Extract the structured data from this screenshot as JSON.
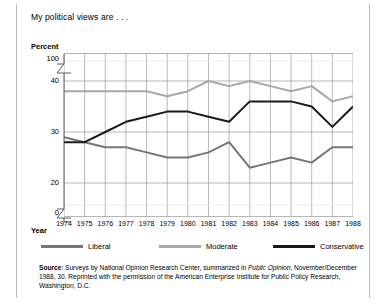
{
  "figure": {
    "question": "My political views are . . .",
    "y_axis_title": "Percent",
    "x_axis_title": "Year"
  },
  "source": {
    "label": "Source",
    "text_part1": ": Surveys by National Opinion Research Center, summarized in ",
    "italic": "Public Opinion",
    "text_part2": ", November/December 1988, 30. Reprinted with the permission of the American Enterprise Institute for Public Policy Research, Washington, D.C."
  },
  "colors": {
    "liberal": "#767676",
    "moderate": "#a8a8a8",
    "conservative": "#1a1a1a",
    "grid": "#9a9a9a",
    "axis": "#4d4d4d",
    "frame": "#b9b9b9"
  },
  "chart_data": {
    "type": "line",
    "title": "My political views are . . .",
    "xlabel": "Year",
    "ylabel": "Percent",
    "ylim": [
      0,
      100
    ],
    "ytick_labels": [
      "100",
      "40",
      "30",
      "20",
      "0"
    ],
    "axis_breaks": [
      "between 100 and 40",
      "between 20 and 0"
    ],
    "grid": true,
    "legend_position": "below",
    "categories": [
      "1974",
      "1975",
      "1976",
      "1977",
      "1978",
      "1979",
      "1980",
      "1981",
      "1982",
      "1983",
      "1984",
      "1985",
      "1986",
      "1987",
      "1988"
    ],
    "series": [
      {
        "name": "Liberal",
        "color": "#767676",
        "values": [
          29,
          28,
          27,
          27,
          26,
          25,
          25,
          26,
          28,
          23,
          24,
          25,
          24,
          27,
          27
        ]
      },
      {
        "name": "Moderate",
        "color": "#a8a8a8",
        "values": [
          38,
          38,
          38,
          38,
          38,
          37,
          38,
          40,
          39,
          40,
          39,
          38,
          39,
          36,
          37
        ]
      },
      {
        "name": "Conservative",
        "color": "#1a1a1a",
        "values": [
          28,
          28,
          30,
          32,
          33,
          34,
          34,
          33,
          32,
          36,
          36,
          36,
          35,
          31,
          35
        ]
      }
    ]
  }
}
